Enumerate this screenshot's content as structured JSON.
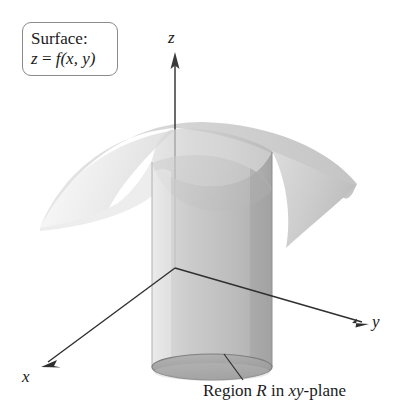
{
  "figure": {
    "title_box": {
      "line1": "Surface:",
      "line2_z": "z",
      "line2_eq": " = ",
      "line2_f": "f",
      "line2_args": "(x, y)"
    },
    "axes": {
      "z_label": "z",
      "y_label": "y",
      "x_label": "x"
    },
    "caption": {
      "prefix": "Region ",
      "region_symbol": "R",
      "middle": " in ",
      "plane_symbol": "xy",
      "suffix": "-plane"
    },
    "colors": {
      "background": "#ffffff",
      "ink": "#1a1a1a",
      "box_border": "#8a8a8a",
      "axis": "#3a3a3a",
      "surface_light": "#f2f2f2",
      "surface_mid": "#d8d8d8",
      "surface_dark": "#b9b9b9",
      "cylinder_light": "#e3e3e3",
      "cylinder_mid": "#c9c9c9",
      "cylinder_dark": "#a9a9a9",
      "base_edge": "#8d8d8d"
    },
    "geometry": {
      "origin_x": 175,
      "origin_y": 268,
      "cylinder_left": 152,
      "cylinder_right": 272,
      "cylinder_top_y": 150,
      "cylinder_base_y": 367,
      "base_rx": 60,
      "base_ry": 13,
      "surface_peak_y": 128,
      "surface_left_tip_x": 40,
      "surface_right_tip_x": 357
    }
  }
}
